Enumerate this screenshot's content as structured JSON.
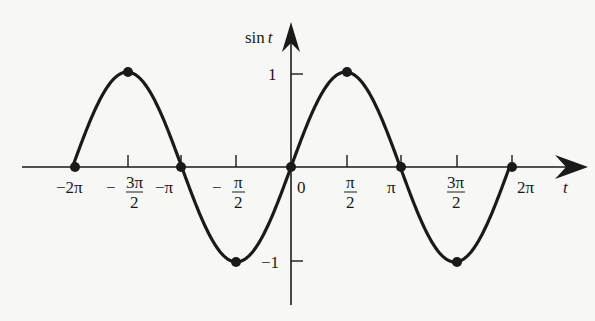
{
  "chart_data": {
    "type": "line",
    "title": "",
    "function": "sin t",
    "xlabel": "t",
    "ylabel": "sin t",
    "xlim": [
      -6.9,
      8.5
    ],
    "ylim": [
      -1.6,
      1.9
    ],
    "x_ticks": [
      {
        "value": -6.2832,
        "label": "−2π"
      },
      {
        "value": -4.7124,
        "label_num": "3π",
        "label_den": "2",
        "sign": "−"
      },
      {
        "value": -3.1416,
        "label": "−π"
      },
      {
        "value": -1.5708,
        "label_num": "π",
        "label_den": "2",
        "sign": "−"
      },
      {
        "value": 0,
        "label": "0"
      },
      {
        "value": 1.5708,
        "label_num": "π",
        "label_den": "2"
      },
      {
        "value": 3.1416,
        "label": "π"
      },
      {
        "value": 4.7124,
        "label_num": "3π",
        "label_den": "2"
      },
      {
        "value": 6.2832,
        "label": "2π"
      }
    ],
    "y_ticks": [
      {
        "value": 1,
        "label": "1"
      },
      {
        "value": -1,
        "label": "−1"
      }
    ],
    "highlighted_points": [
      {
        "t": "-2π",
        "x": -6.2832,
        "y": 0
      },
      {
        "t": "-3π/2",
        "x": -4.7124,
        "y": 1
      },
      {
        "t": "-π",
        "x": -3.1416,
        "y": 0
      },
      {
        "t": "-π/2",
        "x": -1.5708,
        "y": -1
      },
      {
        "t": "0",
        "x": 0,
        "y": 0
      },
      {
        "t": "π/2",
        "x": 1.5708,
        "y": 1
      },
      {
        "t": "π",
        "x": 3.1416,
        "y": 0
      },
      {
        "t": "3π/2",
        "x": 4.7124,
        "y": -1
      },
      {
        "t": "2π",
        "x": 6.2832,
        "y": 0
      }
    ],
    "domain": [
      -6.2832,
      6.2832
    ],
    "grid": false,
    "legend": null
  },
  "labels": {
    "y_axis": "sin",
    "y_axis_var": "t",
    "x_axis_var": "t",
    "tick_neg_2pi": "−2π",
    "tick_neg_3pi2_sign": "−",
    "tick_neg_3pi2_num": "3π",
    "tick_neg_3pi2_den": "2",
    "tick_neg_pi": "−π",
    "tick_neg_pi2_sign": "−",
    "tick_neg_pi2_num": "π",
    "tick_neg_pi2_den": "2",
    "tick_zero": "0",
    "tick_pi2_num": "π",
    "tick_pi2_den": "2",
    "tick_pi": "π",
    "tick_3pi2_num": "3π",
    "tick_3pi2_den": "2",
    "tick_2pi": "2π",
    "y_one": "1",
    "y_neg_one": "−1"
  },
  "colors": {
    "ink": "#1a1a1a",
    "background": "#f7f7f5"
  }
}
